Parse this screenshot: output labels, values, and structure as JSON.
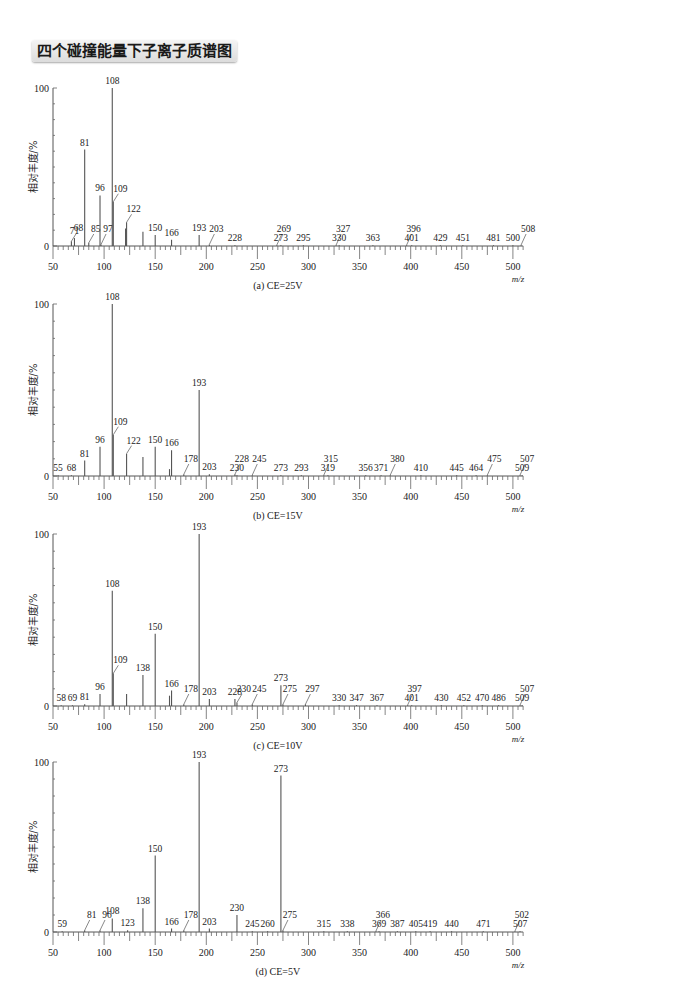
{
  "title": "四个碰撞能量下子离子质谱图",
  "chart_data": [
    {
      "type": "bar",
      "subtype": "mass-spectrum",
      "caption": "(a) CE=25V",
      "ylabel": "相对丰度/%",
      "xlabel": "m/z",
      "xlim": [
        50,
        510
      ],
      "ylim": [
        0,
        100
      ],
      "yticks": [
        "0",
        "100"
      ],
      "xticks": [
        "50",
        "100",
        "150",
        "200",
        "250",
        "300",
        "350",
        "400",
        "450",
        "500"
      ],
      "peaks": [
        {
          "mz": 68,
          "intensity": 3,
          "label": "68",
          "leader": true
        },
        {
          "mz": 71,
          "intensity": 5,
          "label": "71",
          "leader": false
        },
        {
          "mz": 81,
          "intensity": 61,
          "label": "81"
        },
        {
          "mz": 85,
          "intensity": 2,
          "label": "85",
          "leader": true
        },
        {
          "mz": 96,
          "intensity": 32,
          "label": "96"
        },
        {
          "mz": 97,
          "intensity": 1,
          "label": "97",
          "leader": true
        },
        {
          "mz": 108,
          "intensity": 100,
          "label": "108"
        },
        {
          "mz": 109,
          "intensity": 28,
          "label": "109",
          "leader": true
        },
        {
          "mz": 121,
          "intensity": 11,
          "label": ""
        },
        {
          "mz": 122,
          "intensity": 15,
          "label": "122",
          "leader": true
        },
        {
          "mz": 138,
          "intensity": 9,
          "label": ""
        },
        {
          "mz": 150,
          "intensity": 7,
          "label": "150"
        },
        {
          "mz": 166,
          "intensity": 4,
          "label": "166"
        },
        {
          "mz": 193,
          "intensity": 7,
          "label": "193"
        },
        {
          "mz": 203,
          "intensity": 1,
          "label": "203",
          "leader": true
        },
        {
          "mz": 228,
          "intensity": 0.5,
          "label": "228"
        },
        {
          "mz": 269,
          "intensity": 0.5,
          "label": "269",
          "leader": true
        },
        {
          "mz": 273,
          "intensity": 0.5,
          "label": "273"
        },
        {
          "mz": 295,
          "intensity": 0.5,
          "label": "295"
        },
        {
          "mz": 327,
          "intensity": 0.5,
          "label": "327",
          "leader": true
        },
        {
          "mz": 330,
          "intensity": 0.5,
          "label": "330"
        },
        {
          "mz": 363,
          "intensity": 0.5,
          "label": "363"
        },
        {
          "mz": 396,
          "intensity": 0.5,
          "label": "396",
          "leader": true
        },
        {
          "mz": 401,
          "intensity": 0.5,
          "label": "401"
        },
        {
          "mz": 429,
          "intensity": 0.5,
          "label": "429"
        },
        {
          "mz": 451,
          "intensity": 0.5,
          "label": "451"
        },
        {
          "mz": 481,
          "intensity": 0.5,
          "label": "481"
        },
        {
          "mz": 500,
          "intensity": 0.5,
          "label": "500"
        },
        {
          "mz": 508,
          "intensity": 0.5,
          "label": "508",
          "leader": true
        }
      ]
    },
    {
      "type": "bar",
      "subtype": "mass-spectrum",
      "caption": "(b) CE=15V",
      "ylabel": "相对丰度/%",
      "xlabel": "m/z",
      "xlim": [
        50,
        510
      ],
      "ylim": [
        0,
        100
      ],
      "yticks": [
        "0",
        "100"
      ],
      "xticks": [
        "50",
        "100",
        "150",
        "200",
        "250",
        "300",
        "350",
        "400",
        "450",
        "500"
      ],
      "peaks": [
        {
          "mz": 55,
          "intensity": 0.5,
          "label": "55"
        },
        {
          "mz": 68,
          "intensity": 0.5,
          "label": "68"
        },
        {
          "mz": 81,
          "intensity": 9,
          "label": "81"
        },
        {
          "mz": 96,
          "intensity": 17,
          "label": "96"
        },
        {
          "mz": 108,
          "intensity": 100,
          "label": "108"
        },
        {
          "mz": 109,
          "intensity": 24,
          "label": "109",
          "leader": true
        },
        {
          "mz": 122,
          "intensity": 13,
          "label": "122",
          "leader": true
        },
        {
          "mz": 138,
          "intensity": 11,
          "label": ""
        },
        {
          "mz": 150,
          "intensity": 17,
          "label": "150"
        },
        {
          "mz": 164,
          "intensity": 4,
          "label": ""
        },
        {
          "mz": 166,
          "intensity": 15,
          "label": "166"
        },
        {
          "mz": 178,
          "intensity": 1,
          "label": "178",
          "leader": true
        },
        {
          "mz": 193,
          "intensity": 50,
          "label": "193"
        },
        {
          "mz": 203,
          "intensity": 1,
          "label": "203"
        },
        {
          "mz": 228,
          "intensity": 1,
          "label": "228",
          "leader": true
        },
        {
          "mz": 230,
          "intensity": 0.5,
          "label": "230"
        },
        {
          "mz": 245,
          "intensity": 0.5,
          "label": "245",
          "leader": true
        },
        {
          "mz": 273,
          "intensity": 0.5,
          "label": "273"
        },
        {
          "mz": 293,
          "intensity": 0.5,
          "label": "293"
        },
        {
          "mz": 315,
          "intensity": 0.5,
          "label": "315",
          "leader": true
        },
        {
          "mz": 319,
          "intensity": 0.5,
          "label": "319"
        },
        {
          "mz": 356,
          "intensity": 0.5,
          "label": "356"
        },
        {
          "mz": 371,
          "intensity": 0.5,
          "label": "371"
        },
        {
          "mz": 380,
          "intensity": 0.5,
          "label": "380",
          "leader": true
        },
        {
          "mz": 410,
          "intensity": 0.5,
          "label": "410"
        },
        {
          "mz": 445,
          "intensity": 0.5,
          "label": "445"
        },
        {
          "mz": 464,
          "intensity": 0.5,
          "label": "464"
        },
        {
          "mz": 475,
          "intensity": 0.5,
          "label": "475",
          "leader": true
        },
        {
          "mz": 507,
          "intensity": 0.5,
          "label": "507",
          "leader": true
        },
        {
          "mz": 509,
          "intensity": 0.5,
          "label": "509"
        }
      ]
    },
    {
      "type": "bar",
      "subtype": "mass-spectrum",
      "caption": "(c) CE=10V",
      "ylabel": "相对丰度/%",
      "xlabel": "m/z",
      "xlim": [
        50,
        510
      ],
      "ylim": [
        0,
        100
      ],
      "yticks": [
        "0",
        "100"
      ],
      "xticks": [
        "50",
        "100",
        "150",
        "200",
        "250",
        "300",
        "350",
        "400",
        "450",
        "500"
      ],
      "peaks": [
        {
          "mz": 58,
          "intensity": 0.5,
          "label": "58"
        },
        {
          "mz": 69,
          "intensity": 0.5,
          "label": "69"
        },
        {
          "mz": 81,
          "intensity": 1,
          "label": "81"
        },
        {
          "mz": 96,
          "intensity": 7,
          "label": "96"
        },
        {
          "mz": 108,
          "intensity": 67,
          "label": "108"
        },
        {
          "mz": 109,
          "intensity": 19,
          "label": "109",
          "leader": true
        },
        {
          "mz": 122,
          "intensity": 7,
          "label": ""
        },
        {
          "mz": 138,
          "intensity": 18,
          "label": "138"
        },
        {
          "mz": 150,
          "intensity": 42,
          "label": "150"
        },
        {
          "mz": 164,
          "intensity": 6,
          "label": ""
        },
        {
          "mz": 166,
          "intensity": 9,
          "label": "166"
        },
        {
          "mz": 178,
          "intensity": 1,
          "label": "178",
          "leader": true
        },
        {
          "mz": 193,
          "intensity": 100,
          "label": "193"
        },
        {
          "mz": 203,
          "intensity": 4,
          "label": "203"
        },
        {
          "mz": 228,
          "intensity": 4,
          "label": "228"
        },
        {
          "mz": 230,
          "intensity": 2,
          "label": "230",
          "leader": true
        },
        {
          "mz": 245,
          "intensity": 1,
          "label": "245",
          "leader": true
        },
        {
          "mz": 273,
          "intensity": 12,
          "label": "273"
        },
        {
          "mz": 275,
          "intensity": 1,
          "label": "275",
          "leader": true
        },
        {
          "mz": 297,
          "intensity": 1,
          "label": "297",
          "leader": true
        },
        {
          "mz": 330,
          "intensity": 0.5,
          "label": "330"
        },
        {
          "mz": 347,
          "intensity": 0.5,
          "label": "347"
        },
        {
          "mz": 367,
          "intensity": 0.5,
          "label": "367"
        },
        {
          "mz": 397,
          "intensity": 0.5,
          "label": "397",
          "leader": true
        },
        {
          "mz": 401,
          "intensity": 0.5,
          "label": "401"
        },
        {
          "mz": 430,
          "intensity": 0.5,
          "label": "430"
        },
        {
          "mz": 452,
          "intensity": 0.5,
          "label": "452"
        },
        {
          "mz": 470,
          "intensity": 0.5,
          "label": "470"
        },
        {
          "mz": 486,
          "intensity": 0.5,
          "label": "486"
        },
        {
          "mz": 507,
          "intensity": 0.5,
          "label": "507",
          "leader": true
        },
        {
          "mz": 509,
          "intensity": 0.5,
          "label": "509"
        }
      ]
    },
    {
      "type": "bar",
      "subtype": "mass-spectrum",
      "caption": "(d) CE=5V",
      "ylabel": "相对丰度/%",
      "xlabel": "m/z",
      "xlim": [
        50,
        510
      ],
      "ylim": [
        0,
        100
      ],
      "yticks": [
        "0",
        "100"
      ],
      "xticks": [
        "50",
        "100",
        "150",
        "200",
        "250",
        "300",
        "350",
        "400",
        "450",
        "500"
      ],
      "peaks": [
        {
          "mz": 59,
          "intensity": 0.5,
          "label": "59"
        },
        {
          "mz": 81,
          "intensity": 1,
          "label": "81",
          "leader": true
        },
        {
          "mz": 96,
          "intensity": 1,
          "label": "96",
          "leader": true
        },
        {
          "mz": 108,
          "intensity": 8,
          "label": "108"
        },
        {
          "mz": 123,
          "intensity": 1,
          "label": "123"
        },
        {
          "mz": 138,
          "intensity": 14,
          "label": "138"
        },
        {
          "mz": 150,
          "intensity": 45,
          "label": "150"
        },
        {
          "mz": 166,
          "intensity": 2,
          "label": "166"
        },
        {
          "mz": 178,
          "intensity": 1,
          "label": "178",
          "leader": true
        },
        {
          "mz": 193,
          "intensity": 100,
          "label": "193"
        },
        {
          "mz": 203,
          "intensity": 2,
          "label": "203"
        },
        {
          "mz": 230,
          "intensity": 10,
          "label": "230"
        },
        {
          "mz": 245,
          "intensity": 0.5,
          "label": "245"
        },
        {
          "mz": 260,
          "intensity": 0.5,
          "label": "260"
        },
        {
          "mz": 273,
          "intensity": 92,
          "label": "273"
        },
        {
          "mz": 275,
          "intensity": 1,
          "label": "275",
          "leader": true
        },
        {
          "mz": 315,
          "intensity": 0.5,
          "label": "315"
        },
        {
          "mz": 338,
          "intensity": 0.5,
          "label": "338"
        },
        {
          "mz": 366,
          "intensity": 0.5,
          "label": "366",
          "leader": true
        },
        {
          "mz": 369,
          "intensity": 0.5,
          "label": "369"
        },
        {
          "mz": 387,
          "intensity": 0.5,
          "label": "387"
        },
        {
          "mz": 405,
          "intensity": 0.5,
          "label": "405"
        },
        {
          "mz": 419,
          "intensity": 0.5,
          "label": "419"
        },
        {
          "mz": 440,
          "intensity": 0.5,
          "label": "440"
        },
        {
          "mz": 471,
          "intensity": 0.5,
          "label": "471"
        },
        {
          "mz": 502,
          "intensity": 0.5,
          "label": "502",
          "leader": true
        },
        {
          "mz": 507,
          "intensity": 0.5,
          "label": "507"
        }
      ]
    }
  ],
  "layout": {
    "panels": [
      {
        "top": 70,
        "y100": 18,
        "y0": 176
      },
      {
        "top": 300,
        "y100": 4,
        "y0": 176
      },
      {
        "top": 530,
        "y100": 4,
        "y0": 176
      },
      {
        "top": 758,
        "y100": 4,
        "y0": 174
      }
    ],
    "x_at_50": 53,
    "px_per_unit": 1.022
  }
}
